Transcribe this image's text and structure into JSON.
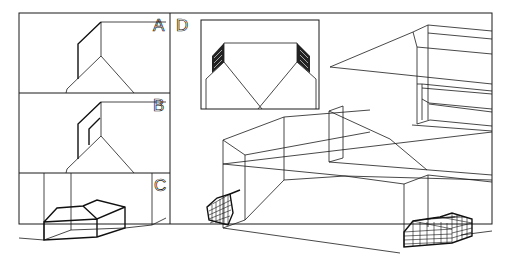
{
  "figure": {
    "panels": [
      {
        "id": "A",
        "label": "A",
        "description": "Corner of room with wall panel, single outline"
      },
      {
        "id": "B",
        "label": "B",
        "description": "Corner of room with wall panel and inset window"
      },
      {
        "id": "C",
        "label": "C",
        "description": "Room with box-shaped object on floor"
      },
      {
        "id": "D",
        "label": "D",
        "description": "Perspective wireframe of corridor and room with grid-meshed objects; inset plan view"
      }
    ],
    "colors": {
      "background": "#ffffff",
      "line": "#1a1a1a"
    }
  }
}
